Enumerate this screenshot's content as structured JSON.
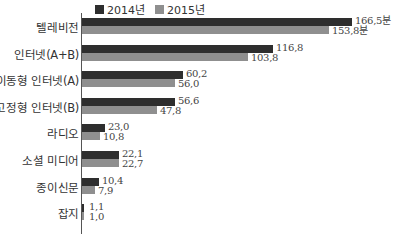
{
  "colors": {
    "y2014": "#2e2e2e",
    "y2015": "#8f8f8f"
  },
  "legend": [
    {
      "label": "2014년",
      "color": "#2e2e2e"
    },
    {
      "label": "2015년",
      "color": "#8f8f8f"
    }
  ],
  "chart_data": {
    "type": "bar",
    "orientation": "horizontal",
    "title": "",
    "xlabel": "",
    "ylabel": "",
    "unit": "분",
    "grid": false,
    "legend_position": "top",
    "categories": [
      "텔레비전",
      "인터넷(A+B)",
      "이동형 인터넷(A)",
      "고정형 인터넷(B)",
      "라디오",
      "소셜 미디어",
      "종이신문",
      "잡지"
    ],
    "series": [
      {
        "name": "2014년",
        "values": [
          166.5,
          116.8,
          60.2,
          56.6,
          23.0,
          22.1,
          10.4,
          1.1
        ]
      },
      {
        "name": "2015년",
        "values": [
          153.8,
          103.8,
          56.0,
          47.8,
          10.8,
          22.7,
          7.9,
          1.0
        ]
      }
    ],
    "value_labels_2014": [
      "166,5분",
      "116,8",
      "60,2",
      "56,6",
      "23,0",
      "22,1",
      "10,4",
      "1,1"
    ],
    "value_labels_2015": [
      "153,8분",
      "103,8",
      "56,0",
      "47,8",
      "10,8",
      "22,7",
      "7,9",
      "1,0"
    ]
  },
  "rows": [
    {
      "label": "텔레비전",
      "w14": 270,
      "w15": 247,
      "v14": "166,5분",
      "v15": "153,8분"
    },
    {
      "label": "인터넷(A+B)",
      "w14": 191,
      "w15": 166,
      "v14": "116,8",
      "v15": "103,8"
    },
    {
      "label": "이동형 인터넷(A)",
      "w14": 101,
      "w15": 93,
      "v14": "60,2",
      "v15": "56,0"
    },
    {
      "label": "고정형 인터넷(B)",
      "w14": 93,
      "w15": 75,
      "v14": "56,6",
      "v15": "47,8"
    },
    {
      "label": "라디오",
      "w14": 23,
      "w15": 18,
      "v14": "23,0",
      "v15": "10,8"
    },
    {
      "label": "소셜 미디어",
      "w14": 37,
      "w15": 37,
      "v14": "22,1",
      "v15": "22,7"
    },
    {
      "label": "종이신문",
      "w14": 17,
      "w15": 13,
      "v14": "10,4",
      "v15": "7,9"
    },
    {
      "label": "잡지",
      "w14": 2,
      "w15": 2,
      "v14": "1,1",
      "v15": "1,0"
    }
  ]
}
